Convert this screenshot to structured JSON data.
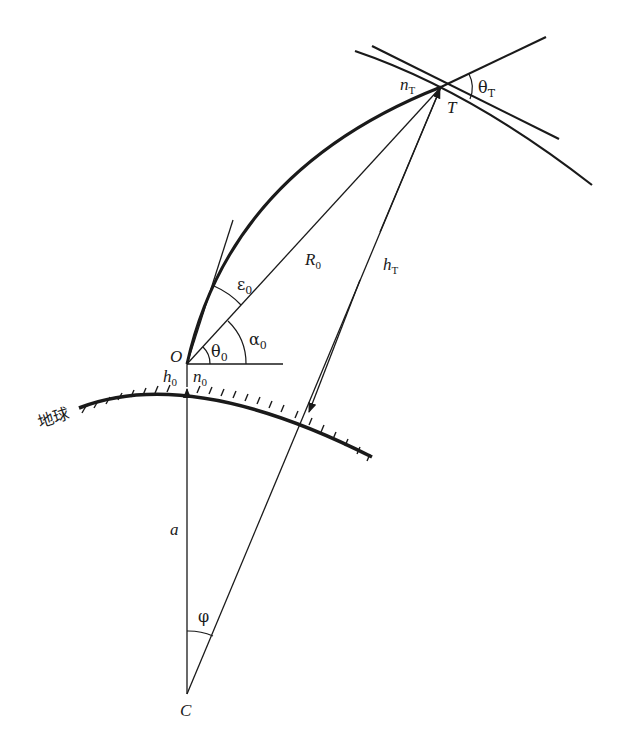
{
  "diagram": {
    "type": "radio-ray-refraction-geometry",
    "labels": {
      "O": "O",
      "T": "T",
      "C": "C",
      "a": "a",
      "R0": "R",
      "R0_sub": "0",
      "hT": "h",
      "hT_sub": "T",
      "h0": "h",
      "h0_sub": "0",
      "n0": "n",
      "n0_sub": "0",
      "nT": "n",
      "nT_sub": "T",
      "theta0": "θ",
      "theta0_sub": "0",
      "thetaT": "θ",
      "thetaT_sub": "T",
      "alpha0": "α",
      "alpha0_sub": "0",
      "epsilon0": "ε",
      "epsilon0_sub": "0",
      "phi": "φ",
      "earth": "地球"
    },
    "colors": {
      "ink": "#1a1a1a",
      "background": "#ffffff"
    }
  }
}
